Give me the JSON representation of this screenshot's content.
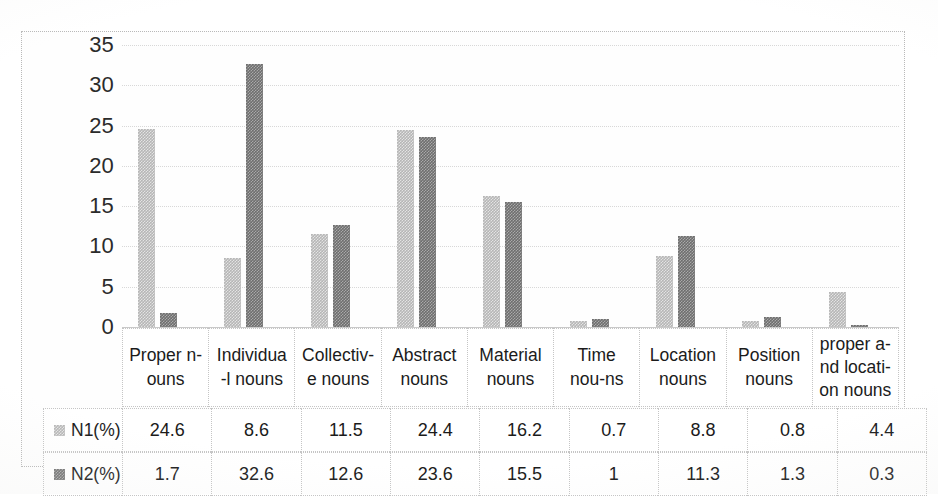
{
  "chart_data": {
    "type": "bar",
    "title": "",
    "subtitle": "",
    "xlabel": "",
    "ylabel": "",
    "grid": true,
    "legend_position": "table-left",
    "ylim": [
      0,
      35
    ],
    "ytick_labels": [
      "35",
      "30",
      "25",
      "20",
      "15",
      "10",
      "5",
      "0"
    ],
    "yticks": [
      35,
      30,
      25,
      20,
      15,
      10,
      5,
      0
    ],
    "categories": [
      "Proper n-\nouns",
      "Individua\n-l nouns",
      "Collectiv-\ne nouns",
      "Abstract\nnouns",
      "Material\nnouns",
      "Time\nnou-ns",
      "Location\nnouns",
      "Position\nnouns",
      "proper a-\nnd locati-\non nouns"
    ],
    "series": [
      {
        "name": "N1(%)",
        "color": "#b6b6b6",
        "values": [
          24.6,
          8.6,
          11.5,
          24.4,
          16.2,
          0.7,
          8.8,
          0.8,
          4.4
        ]
      },
      {
        "name": "N2(%)",
        "color": "#6e6e6e",
        "values": [
          1.7,
          32.6,
          12.6,
          23.6,
          15.5,
          1,
          11.3,
          1.3,
          0.3
        ]
      }
    ]
  },
  "table": {
    "rows": [
      {
        "label": "N1(%)",
        "swatch": "light-gray-swatch",
        "cells": [
          "24.6",
          "8.6",
          "11.5",
          "24.4",
          "16.2",
          "0.7",
          "8.8",
          "0.8",
          "4.4"
        ]
      },
      {
        "label": "N2(%)",
        "swatch": "dark-gray-swatch",
        "cells": [
          "1.7",
          "32.6",
          "12.6",
          "23.6",
          "15.5",
          "1",
          "11.3",
          "1.3",
          "0.3"
        ]
      }
    ]
  },
  "colors": {
    "series_n1": "#b6b6b6",
    "series_n2": "#6e6e6e",
    "gridline": "#d8d8d8",
    "border": "#c5c5c5",
    "text": "#1b1b1b",
    "background": "#ffffff"
  }
}
